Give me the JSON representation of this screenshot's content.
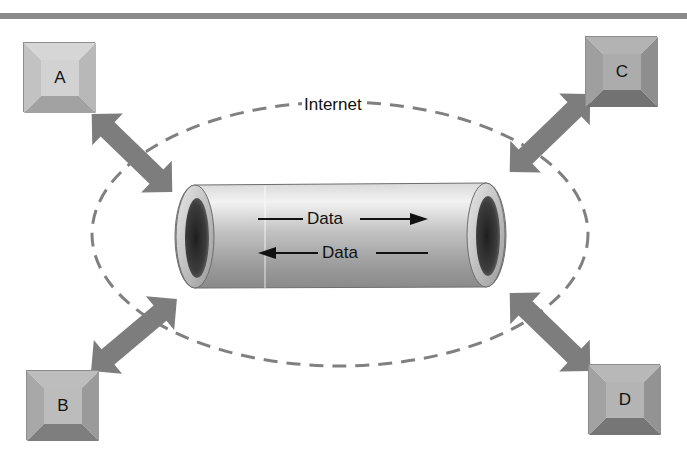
{
  "diagram": {
    "title": "",
    "cloud_label": "Internet",
    "pipe": {
      "forward_label": "Data",
      "reverse_label": "Data"
    },
    "nodes": [
      {
        "id": "A",
        "label": "A",
        "shade": "light"
      },
      {
        "id": "B",
        "label": "B",
        "shade": "medium"
      },
      {
        "id": "C",
        "label": "C",
        "shade": "dark"
      },
      {
        "id": "D",
        "label": "D",
        "shade": "medium"
      }
    ],
    "connections": [
      {
        "from": "A",
        "to": "pipe",
        "type": "bidirectional"
      },
      {
        "from": "B",
        "to": "pipe",
        "type": "bidirectional"
      },
      {
        "from": "C",
        "to": "pipe",
        "type": "bidirectional"
      },
      {
        "from": "D",
        "to": "pipe",
        "type": "bidirectional"
      }
    ],
    "colors": {
      "rule": "#8a8a8a",
      "arrow": "#7d7d7d",
      "dash": "#808080",
      "pipe_dark": "#4a4a4a",
      "pipe_light": "#e6e6e6"
    }
  }
}
